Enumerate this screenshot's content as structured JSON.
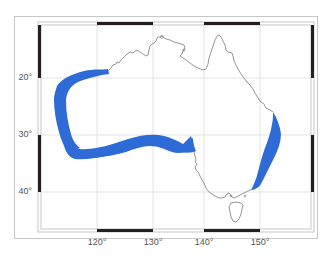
{
  "map": {
    "region": "Australia",
    "highlight_color": "#2e6bd6",
    "coastline_color": "#7a7a7a",
    "grid_color": "#dcdcdc",
    "frame_bar_color": "#231f20",
    "highlighted_regions": [
      {
        "name": "west-and-south-coast-band",
        "description": "Coastal band from northwest (~20°S) down the west coast and along the south coast to ~138°E"
      },
      {
        "name": "east-coast-band",
        "description": "Coastal band along the east coast from ~27°S to ~37°S"
      }
    ]
  },
  "axes": {
    "latitude_ticks": [
      {
        "label": "20°",
        "value": -20
      },
      {
        "label": "30°",
        "value": -30
      },
      {
        "label": "40°",
        "value": -40
      }
    ],
    "longitude_ticks": [
      {
        "label": "120°",
        "value": 120
      },
      {
        "label": "130°",
        "value": 130
      },
      {
        "label": "140°",
        "value": 140
      },
      {
        "label": "150°",
        "value": 150
      }
    ]
  }
}
